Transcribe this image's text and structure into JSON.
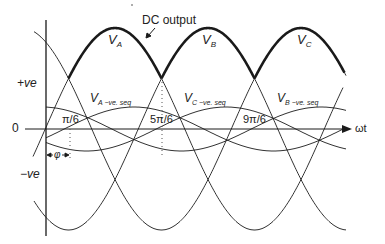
{
  "figure": {
    "title_annotation": "DC output",
    "axis": {
      "x_label": "ωt",
      "zero_label": "0",
      "pos_label": "+ve",
      "neg_label": "−ve"
    },
    "phase_labels": [
      {
        "main": "V",
        "sub": "A"
      },
      {
        "main": "V",
        "sub": "B"
      },
      {
        "main": "V",
        "sub": "C"
      }
    ],
    "neg_seq_labels": [
      {
        "main": "V",
        "sub": "A",
        "suffix": "−ve. seq"
      },
      {
        "main": "V",
        "sub": "C",
        "suffix": "−ve. seq"
      },
      {
        "main": "V",
        "sub": "B",
        "suffix": "−ve. seq"
      }
    ],
    "angle_labels": [
      "π/6",
      "5π/6",
      "9π/6"
    ],
    "phi_label": "φ"
  },
  "geometry": {
    "origin_x": 46,
    "zero_y": 129,
    "amplitude": 101,
    "period_px": 279,
    "neg_seq_amplitude": 22,
    "colors": {
      "stroke": "#1a1a1a",
      "text": "#222222"
    }
  }
}
